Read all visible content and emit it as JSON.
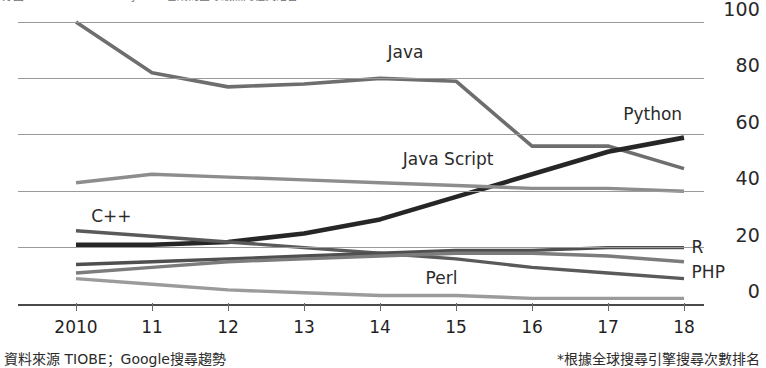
{
  "header": {
    "left_clipped": "分圖",
    "center_clipped": "Python 已成為全球最熱門程式語言"
  },
  "footnotes": {
    "left": "資料來源 TIOBE；Google搜尋趨勢",
    "right": "*根據全球搜尋引擎搜尋次數排名"
  },
  "chart_data": {
    "type": "line",
    "title": "",
    "xlabel": "",
    "ylabel": "",
    "x": [
      2010,
      2011,
      2012,
      2013,
      2014,
      2015,
      2016,
      2017,
      2018
    ],
    "xticklabels": [
      "2010",
      "11",
      "12",
      "13",
      "14",
      "15",
      "16",
      "17",
      "18"
    ],
    "yticklabels": [
      "0",
      "20",
      "40",
      "60",
      "80",
      "100"
    ],
    "yticks": [
      0,
      20,
      40,
      60,
      80,
      100
    ],
    "ylim": [
      0,
      100
    ],
    "xlim": [
      2010,
      2018
    ],
    "grid": true,
    "legend": "inline-labels",
    "series": [
      {
        "name": "Java",
        "label": "Java",
        "color": "#6e6e6e",
        "width": 3.6,
        "values": [
          100,
          82,
          77,
          78,
          80,
          79,
          56,
          56,
          48
        ],
        "label_x": 2014.1,
        "label_y": 89
      },
      {
        "name": "Python",
        "label": "Python",
        "color": "#262626",
        "width": 4.6,
        "values": [
          21,
          21,
          22,
          25,
          30,
          38,
          46,
          54,
          59
        ],
        "label_x": 2017.2,
        "label_y": 67
      },
      {
        "name": "Java Script",
        "label": "Java Script",
        "color": "#8d8d8d",
        "width": 3.4,
        "values": [
          43,
          46,
          45,
          44,
          43,
          42,
          41,
          41,
          40
        ],
        "label_x": 2014.3,
        "label_y": 51
      },
      {
        "name": "C++",
        "label": "C++",
        "color": "#5a5a5a",
        "width": 3.4,
        "values": [
          26,
          24,
          22,
          20,
          18,
          16,
          13,
          11,
          9
        ],
        "label_x": 2010.2,
        "label_y": 31
      },
      {
        "name": "R",
        "label": "R",
        "color": "#4f4f4f",
        "width": 3.4,
        "values": [
          14,
          15,
          16,
          17,
          18,
          19,
          19,
          20,
          20
        ],
        "label_x": 2018.1,
        "label_y": 20
      },
      {
        "name": "PHP",
        "label": "PHP",
        "color": "#7c7c7c",
        "width": 3.4,
        "values": [
          11,
          13,
          15,
          16,
          17,
          18,
          18,
          17,
          15
        ],
        "label_x": 2018.1,
        "label_y": 11
      },
      {
        "name": "Perl",
        "label": "Perl",
        "color": "#9b9b9b",
        "width": 3.4,
        "values": [
          9,
          7,
          5,
          4,
          3,
          3,
          2,
          2,
          2
        ],
        "label_x": 2014.6,
        "label_y": 9
      }
    ]
  }
}
